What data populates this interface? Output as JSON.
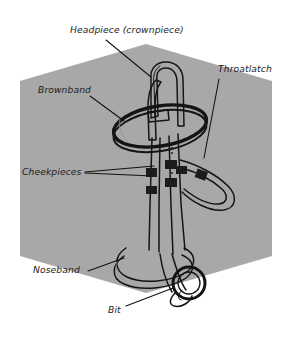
{
  "figure": {
    "background_color": "#ffffff",
    "panel_color": "#a8a8a8",
    "ink_color": "#1a1a1a",
    "panel_shape": "hexagon"
  },
  "labels": [
    {
      "id": "headpiece",
      "text": "Headpiece (crownpiece)",
      "x": 70,
      "y": 33,
      "anchor": "start"
    },
    {
      "id": "throatlatch",
      "text": "Throatlatch",
      "x": 218,
      "y": 72,
      "anchor": "start"
    },
    {
      "id": "brownband",
      "text": "Brownband",
      "x": 38,
      "y": 93,
      "anchor": "start"
    },
    {
      "id": "cheekpieces",
      "text": "Cheekpieces",
      "x": 22,
      "y": 175,
      "anchor": "start"
    },
    {
      "id": "noseband",
      "text": "Noseband",
      "x": 33,
      "y": 273,
      "anchor": "start"
    },
    {
      "id": "bit",
      "text": "Bit",
      "x": 108,
      "y": 313,
      "anchor": "start"
    }
  ],
  "leader_lines": [
    {
      "id": "headpiece-leader",
      "points": "106,40 151,77"
    },
    {
      "id": "throatlatch-leader",
      "points": "219,79 204,158"
    },
    {
      "id": "brownband-leader",
      "points": "90,96 124,121"
    },
    {
      "id": "cheekpieces-leader-upper",
      "points": "85,172 154,166"
    },
    {
      "id": "cheekpieces-leader-lower",
      "points": "85,173 152,176"
    },
    {
      "id": "noseband-leader",
      "points": "88,271 124,258"
    },
    {
      "id": "bit-leader",
      "points": "126,306 173,288"
    }
  ],
  "panel": {
    "hexagon_points": "146,44 272,81 272,256 146,293 20,256 20,81"
  }
}
